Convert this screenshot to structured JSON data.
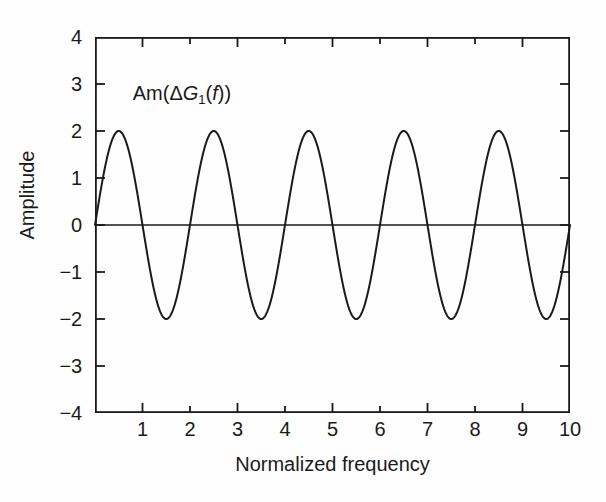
{
  "figure": {
    "background_color": "#fefefe",
    "line_color": "#1a1a1a",
    "axis_color": "#1a1a1a"
  },
  "annotation": {
    "prefix": "Am(",
    "delta": "Δ",
    "g": "G",
    "subscript": "1",
    "mid": "(",
    "f": "f",
    "suffix": "))"
  },
  "chart_data": {
    "type": "line",
    "title": "",
    "subtitle": "",
    "xlabel": "Normalized frequency",
    "ylabel": "Amplitude",
    "xlim": [
      0,
      10
    ],
    "ylim": [
      -4,
      4
    ],
    "xticks": [
      0,
      1,
      2,
      3,
      4,
      5,
      6,
      7,
      8,
      9,
      10
    ],
    "xtick_labels": [
      "",
      "1",
      "2",
      "3",
      "4",
      "5",
      "6",
      "7",
      "8",
      "9",
      "10"
    ],
    "yticks": [
      -4,
      -3,
      -2,
      -1,
      0,
      1,
      2,
      3,
      4
    ],
    "ytick_labels": [
      "−4",
      "−3",
      "−2",
      "−1",
      "0",
      "1",
      "2",
      "3",
      "4"
    ],
    "grid": false,
    "legend": null,
    "zero_line": true,
    "ticks_direction": "in",
    "ticks_on_all_sides": true,
    "annotations": [
      {
        "text": "Am(ΔG₁(f))",
        "x": 2.1,
        "y": 2.8
      }
    ],
    "series": [
      {
        "name": "Am(ΔG₁(f))",
        "formula": "2*sin(pi*x)",
        "amplitude": 2,
        "period": 2,
        "phase": 0,
        "color": "#1a1a1a",
        "linewidth": 2,
        "x": [
          0,
          0.25,
          0.5,
          0.75,
          1,
          1.25,
          1.5,
          1.75,
          2,
          2.25,
          2.5,
          2.75,
          3,
          3.25,
          3.5,
          3.75,
          4,
          4.25,
          4.5,
          4.75,
          5,
          5.25,
          5.5,
          5.75,
          6,
          6.25,
          6.5,
          6.75,
          7,
          7.25,
          7.5,
          7.75,
          8,
          8.25,
          8.5,
          8.75,
          9,
          9.25,
          9.5,
          9.75,
          10
        ],
        "y": [
          0,
          1.41,
          2,
          1.41,
          0,
          -1.41,
          -2,
          -1.41,
          0,
          1.41,
          2,
          1.41,
          0,
          -1.41,
          -2,
          -1.41,
          0,
          1.41,
          2,
          1.41,
          0,
          -1.41,
          -2,
          -1.41,
          0,
          1.41,
          2,
          1.41,
          0,
          -1.41,
          -2,
          -1.41,
          0,
          1.41,
          2,
          1.41,
          0,
          -1.41,
          -2,
          -1.41,
          0
        ],
        "peaks_at": [
          0.5,
          2.5,
          4.5,
          6.5,
          8.5
        ],
        "troughs_at": [
          1.5,
          3.5,
          5.5,
          7.5,
          9.5
        ],
        "zero_crossings": [
          0,
          1,
          2,
          3,
          4,
          5,
          6,
          7,
          8,
          9,
          10
        ]
      }
    ]
  }
}
